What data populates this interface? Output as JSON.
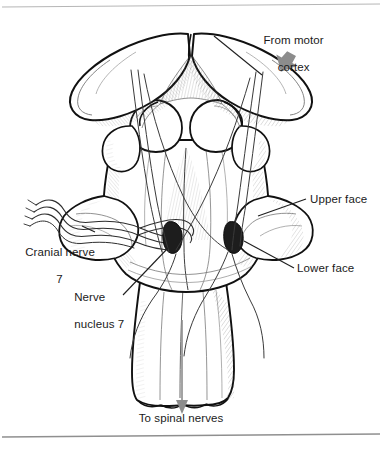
{
  "figure": {
    "title_visible": false,
    "colors": {
      "ink": "#111111",
      "line": "#2b2b2b",
      "fiber": "#3a3a3a",
      "nucleus_fill": "#1d1d1d",
      "arrow_gray": "#8a8a8a",
      "border": "#9a9a9a",
      "background": "#ffffff",
      "shade_light": "#e8e8e8",
      "shade_mid": "#cfcfcf"
    },
    "labels": {
      "from_motor_cortex": {
        "line1": "From motor",
        "line2": "cortex"
      },
      "upper_face": "Upper face",
      "lower_face": "Lower face",
      "cranial_nerve": {
        "line1": "Cranial nerve",
        "line2": "7"
      },
      "nerve_nucleus": {
        "line1": "Nerve",
        "line2": "nucleus 7"
      },
      "to_spinal_nerves": "To spinal nerves"
    },
    "icons": {
      "motor_cortex_arrow": "down-left-arrow-icon",
      "spinal_arrow": "down-arrow-icon"
    },
    "structures": [
      {
        "name": "superior-colliculi",
        "count": 2
      },
      {
        "name": "inferior-colliculi",
        "count": 2
      },
      {
        "name": "cerebellar-peduncles",
        "count": 2
      },
      {
        "name": "facial-nerve-nucleus",
        "count": 2
      },
      {
        "name": "medulla-oblongata",
        "count": 1
      },
      {
        "name": "cranial-nerve-7-fibers",
        "count": 4
      }
    ]
  }
}
